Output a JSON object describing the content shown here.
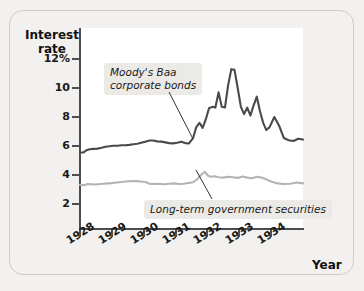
{
  "chart_data": {
    "type": "line",
    "ylabel": "Interest rate",
    "xlabel": "Year",
    "ylim": [
      0,
      13
    ],
    "xlim": [
      1928,
      1935
    ],
    "grid": false,
    "legend": "annotations",
    "ytick_labels": [
      "12%",
      "10",
      "8",
      "6",
      "4",
      "2"
    ],
    "ytick_values": [
      12,
      10,
      8,
      6,
      4,
      2
    ],
    "xtick_labels": [
      "1928",
      "1929",
      "1930",
      "1931",
      "1932",
      "1933",
      "1934"
    ],
    "xtick_values": [
      1928,
      1929,
      1930,
      1931,
      1932,
      1933,
      1934
    ],
    "annotations": [
      {
        "name": "baa-callout",
        "text": "Moody's Baa\ncorporate bonds"
      },
      {
        "name": "gov-callout",
        "text": "Long-term government securities"
      }
    ],
    "series": [
      {
        "name": "Moody's Baa corporate bonds",
        "color": "#4a4a4a",
        "x": [
          1928.0,
          1928.1,
          1928.2,
          1928.3,
          1928.42,
          1928.55,
          1928.68,
          1928.8,
          1928.92,
          1929.05,
          1929.18,
          1929.3,
          1929.42,
          1929.55,
          1929.68,
          1929.8,
          1929.92,
          1930.05,
          1930.18,
          1930.3,
          1930.42,
          1930.55,
          1930.68,
          1930.8,
          1930.92,
          1931.05,
          1931.18,
          1931.3,
          1931.42,
          1931.55,
          1931.65,
          1931.75,
          1931.85,
          1931.95,
          1932.05,
          1932.15,
          1932.25,
          1932.35,
          1932.45,
          1932.55,
          1932.65,
          1932.75,
          1932.85,
          1932.95,
          1933.05,
          1933.15,
          1933.25,
          1933.35,
          1933.45,
          1933.55,
          1933.65,
          1933.75,
          1933.85,
          1933.95,
          1934.1,
          1934.25,
          1934.4,
          1934.55,
          1934.7,
          1934.85,
          1935.0
        ],
        "values": [
          5.55,
          5.55,
          5.7,
          5.78,
          5.8,
          5.82,
          5.88,
          5.95,
          5.98,
          6.02,
          6.02,
          6.05,
          6.05,
          6.08,
          6.12,
          6.15,
          6.22,
          6.3,
          6.38,
          6.38,
          6.32,
          6.3,
          6.25,
          6.2,
          6.18,
          6.22,
          6.3,
          6.2,
          6.18,
          6.55,
          7.3,
          7.6,
          7.25,
          7.85,
          8.6,
          8.7,
          8.65,
          9.7,
          8.7,
          8.65,
          10.2,
          11.3,
          11.25,
          10.0,
          8.7,
          8.2,
          8.65,
          8.1,
          8.8,
          9.4,
          8.4,
          7.6,
          7.1,
          7.3,
          8.0,
          7.4,
          6.55,
          6.4,
          6.35,
          6.5,
          6.45
        ]
      },
      {
        "name": "Long-term government securities",
        "color": "#b4b4b0",
        "x": [
          1928.0,
          1928.12,
          1928.25,
          1928.38,
          1928.5,
          1928.62,
          1928.75,
          1928.88,
          1929.0,
          1929.15,
          1929.3,
          1929.45,
          1929.6,
          1929.75,
          1929.9,
          1930.05,
          1930.2,
          1930.35,
          1930.5,
          1930.65,
          1930.8,
          1930.95,
          1931.1,
          1931.25,
          1931.4,
          1931.55,
          1931.7,
          1931.82,
          1931.92,
          1932.02,
          1932.12,
          1932.22,
          1932.35,
          1932.5,
          1932.65,
          1932.8,
          1932.95,
          1933.1,
          1933.25,
          1933.4,
          1933.55,
          1933.7,
          1933.85,
          1934.0,
          1934.2,
          1934.4,
          1934.6,
          1934.8,
          1935.0
        ],
        "values": [
          3.32,
          3.3,
          3.38,
          3.36,
          3.34,
          3.38,
          3.4,
          3.42,
          3.44,
          3.48,
          3.52,
          3.55,
          3.58,
          3.58,
          3.55,
          3.52,
          3.38,
          3.4,
          3.38,
          3.36,
          3.4,
          3.42,
          3.38,
          3.4,
          3.45,
          3.5,
          3.75,
          4.05,
          4.22,
          3.95,
          3.88,
          3.92,
          3.85,
          3.82,
          3.88,
          3.85,
          3.8,
          3.9,
          3.82,
          3.78,
          3.88,
          3.82,
          3.7,
          3.55,
          3.42,
          3.38,
          3.4,
          3.48,
          3.42
        ]
      }
    ]
  },
  "figure": {
    "axis_title": "Interest\nrate",
    "xaxis_title": "Year"
  }
}
